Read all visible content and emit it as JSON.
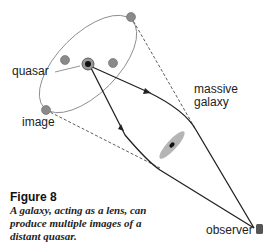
{
  "labels": {
    "quasar": "quasar",
    "image": "image",
    "massive_galaxy_line1": "massive",
    "massive_galaxy_line2": "galaxy",
    "observer": "observer"
  },
  "figure": {
    "title": "Figure 8",
    "caption": "A galaxy, acting as a lens, can produce multiple images of a distant quasar."
  },
  "colors": {
    "line": "#222222",
    "ellipse": "#888888",
    "image_dot": "#8a8a8a",
    "galaxy_halo": "#b5b5b5",
    "observer": "#555555"
  }
}
